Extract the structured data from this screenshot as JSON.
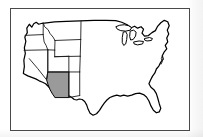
{
  "figure": {
    "kind": "map",
    "title": "",
    "caption": "",
    "region": "Contiguous United States",
    "frame": {
      "border_color": "#4a4a4a",
      "background_color": "#ffffff"
    }
  },
  "map": {
    "projection_label": "",
    "outline_color": "#000000",
    "state_border_color": "#1a1a1a",
    "land_fill_color": "#ffffff",
    "highlight_fill_color": "#9a9a9a",
    "highlighted_states": [
      "Arizona"
    ],
    "visible_state_borders": [
      "Washington",
      "Oregon",
      "California",
      "Idaho",
      "Nevada",
      "Utah",
      "Arizona",
      "Montana",
      "Wyoming",
      "Colorado",
      "New Mexico"
    ],
    "features": [
      "Great Lakes",
      "Florida peninsula",
      "Gulf Coast",
      "Atlantic Coast",
      "Pacific Coast",
      "Chesapeake Bay",
      "Cape Cod"
    ]
  },
  "legend": {
    "visible": false,
    "entries": []
  },
  "labels": {
    "visible": false,
    "items": []
  }
}
